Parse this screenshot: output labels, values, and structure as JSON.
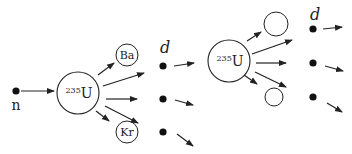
{
  "diagram": {
    "colors": {
      "stroke": "#222222",
      "fill": "#111111",
      "background": "#ffffff"
    },
    "neutron": {
      "label": "n",
      "x": 16,
      "y": 91
    },
    "nuclei": [
      {
        "id": "u235-first",
        "mass": "235",
        "symbol": "U",
        "cx": 78,
        "cy": 93,
        "r": 21
      },
      {
        "id": "u235-second",
        "mass": "235",
        "symbol": "U",
        "cx": 229,
        "cy": 61,
        "r": 21
      }
    ],
    "fragments": [
      {
        "id": "ba",
        "label": "Ba",
        "cx": 127,
        "cy": 55,
        "r": 11
      },
      {
        "id": "kr",
        "label": "Kr",
        "cx": 127,
        "cy": 132,
        "r": 11
      },
      {
        "id": "fragment-top",
        "label": "",
        "cx": 276,
        "cy": 24,
        "r": 12
      },
      {
        "id": "fragment-bottom",
        "label": "",
        "cx": 274,
        "cy": 97,
        "r": 9
      }
    ],
    "neutron_columns": [
      {
        "label": "d",
        "label_x": 160,
        "label_y": 53,
        "dots": [
          {
            "x": 163,
            "y": 66
          },
          {
            "x": 163,
            "y": 99
          },
          {
            "x": 163,
            "y": 132
          }
        ]
      },
      {
        "label": "d",
        "label_x": 310,
        "label_y": 20,
        "dots": [
          {
            "x": 313,
            "y": 29
          },
          {
            "x": 313,
            "y": 63
          },
          {
            "x": 313,
            "y": 97
          }
        ]
      }
    ],
    "arrows": [
      {
        "from": [
          21,
          91
        ],
        "to": [
          54,
          91
        ]
      },
      {
        "from": [
          98,
          75
        ],
        "to": [
          114,
          63
        ]
      },
      {
        "from": [
          96,
          111
        ],
        "to": [
          109,
          121
        ]
      },
      {
        "from": [
          103,
          86
        ],
        "to": [
          144,
          73
        ]
      },
      {
        "from": [
          106,
          99
        ],
        "to": [
          137,
          99
        ]
      },
      {
        "from": [
          105,
          106
        ],
        "to": [
          138,
          123
        ]
      },
      {
        "from": [
          174,
          66
        ],
        "to": [
          194,
          63
        ]
      },
      {
        "from": [
          175,
          100
        ],
        "to": [
          193,
          105
        ]
      },
      {
        "from": [
          177,
          134
        ],
        "to": [
          193,
          146
        ]
      },
      {
        "from": [
          247,
          41
        ],
        "to": [
          261,
          32
        ]
      },
      {
        "from": [
          252,
          54
        ],
        "to": [
          292,
          40
        ]
      },
      {
        "from": [
          256,
          63
        ],
        "to": [
          286,
          63
        ]
      },
      {
        "from": [
          244,
          75
        ],
        "to": [
          257,
          84
        ]
      },
      {
        "from": [
          255,
          72
        ],
        "to": [
          286,
          87
        ]
      },
      {
        "from": [
          323,
          29
        ],
        "to": [
          342,
          27
        ]
      },
      {
        "from": [
          325,
          66
        ],
        "to": [
          343,
          71
        ]
      },
      {
        "from": [
          327,
          103
        ],
        "to": [
          342,
          112
        ]
      }
    ]
  }
}
